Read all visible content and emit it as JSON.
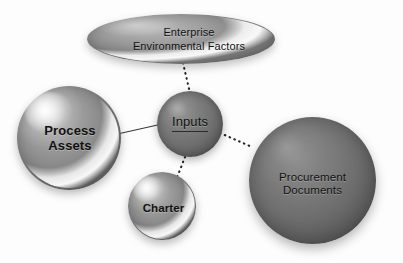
{
  "diagram": {
    "background_color": "#fdfdfd",
    "text_color": "#111111",
    "nodes": [
      {
        "id": "enterprise-environmental-factors",
        "shape": "ellipse",
        "label_line1": "Enterprise",
        "label_line2": "Environmental Factors",
        "fill_color": "#878787",
        "highlight_color": "#ffffff"
      },
      {
        "id": "process-assets",
        "shape": "sphere",
        "label_line1": "Process",
        "label_line2": "Assets",
        "fill_color": "#8a8a8a",
        "highlight_color": "#ffffff"
      },
      {
        "id": "inputs",
        "shape": "sphere",
        "label_line1": "Inputs",
        "label_line2": "",
        "fill_color": "#6e6e6e",
        "highlight_color": "#ffffff"
      },
      {
        "id": "charter",
        "shape": "sphere",
        "label_line1": "Charter",
        "label_line2": "",
        "fill_color": "#8a8a8a",
        "highlight_color": "#ffffff"
      },
      {
        "id": "procurement-documents",
        "shape": "sphere",
        "label_line1": "Procurement",
        "label_line2": "Documents",
        "fill_color": "#6d6d6d",
        "highlight_color": "#ffffff"
      }
    ],
    "connectors": [
      {
        "id": "eef-to-inputs",
        "from": "enterprise-environmental-factors",
        "to": "inputs",
        "style": "dotted",
        "color": "#222222"
      },
      {
        "id": "process-assets-to-inputs",
        "from": "process-assets",
        "to": "inputs",
        "style": "solid",
        "color": "#3a3a3a"
      },
      {
        "id": "inputs-to-charter",
        "from": "inputs",
        "to": "charter",
        "style": "dotted",
        "color": "#222222"
      },
      {
        "id": "inputs-to-procurement-documents",
        "from": "inputs",
        "to": "procurement-documents",
        "style": "dotted",
        "color": "#222222"
      }
    ]
  }
}
